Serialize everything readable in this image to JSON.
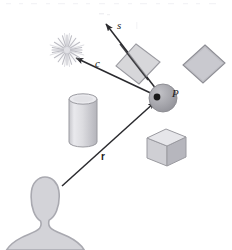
{
  "figure": {
    "background_color": "#ffffff",
    "width": 232,
    "height": 250
  },
  "labels": {
    "s": "s",
    "c": "c",
    "P": "P",
    "r": "r"
  },
  "elements": {
    "light_source": {
      "name": "light-source-starburst",
      "cx": 67,
      "cy": 50,
      "rays": 20,
      "inner_radius": 3,
      "outer_radius": 14,
      "color": "#c9c9cf"
    },
    "shading_point": {
      "name": "shading-point-sphere",
      "cx": 163,
      "cy": 98,
      "r": 14,
      "fill": "#a8a8ad",
      "stroke": "#8a8a90",
      "dot_r": 3.2,
      "dot_fill": "#1a1a1a"
    },
    "translucent_quad": {
      "name": "translucent-plane-quad",
      "points": "136,44 160,62 139,84 116,66",
      "fill": "#c8c8cc",
      "stroke": "#9a9aa0",
      "opacity": 0.72
    },
    "right_quad": {
      "name": "background-plane-quad",
      "points": "205,45 225,63 203,83 183,65",
      "fill": "#c0c0c6",
      "stroke": "#8e8e95"
    },
    "cylinder": {
      "name": "cylinder-object",
      "cx": 83,
      "top_y": 97,
      "bottom_y": 142,
      "rx": 14,
      "ry": 5,
      "body_fill": "#d6d6da",
      "top_fill": "#e6e6ea",
      "stroke": "#9a9aa0"
    },
    "cube": {
      "name": "cube-object",
      "top_face": "166,129 186,137 167,146 147,138",
      "left_face": "147,138 167,146 167,166 147,158",
      "right_face": "167,146 186,137 186,157 167,166",
      "top_fill": "#e4e4e8",
      "left_fill": "#cfcfd4",
      "right_fill": "#b8b8be",
      "stroke": "#9a9aa0"
    },
    "viewer": {
      "name": "viewer-silhouette",
      "fill": "#d3d3d8",
      "stroke": "#a9a9b0"
    }
  },
  "vectors": [
    {
      "name": "specular-reflection-vector-s",
      "label": "s",
      "from": [
        163,
        98
      ],
      "to": [
        104,
        22
      ],
      "color": "#2a2a2e",
      "arrowhead_at": "to"
    },
    {
      "name": "light-direction-vector-c",
      "label": "c",
      "from": [
        157,
        96
      ],
      "to": [
        74,
        57
      ],
      "color": "#2a2a2e",
      "arrowhead_at": "to"
    },
    {
      "name": "view-ray-vector-r",
      "label": "r",
      "from": [
        62,
        186
      ],
      "to": [
        157,
        101
      ],
      "color": "#2a2a2e",
      "arrowhead_at": "to"
    }
  ]
}
